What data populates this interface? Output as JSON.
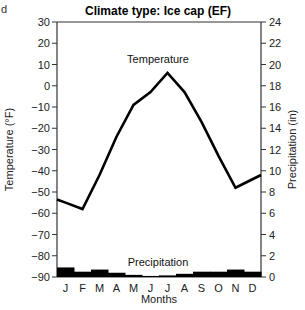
{
  "corner_fragment": "d",
  "chart_data": {
    "type": "line",
    "title": "Climate type: Ice cap (EF)",
    "xlabel": "Months",
    "ylabel": "Temperature (°F)",
    "y2label": "Precipitation (in)",
    "categories": [
      "J",
      "F",
      "M",
      "A",
      "M",
      "J",
      "J",
      "A",
      "S",
      "O",
      "N",
      "D"
    ],
    "ylim": [
      -90,
      30
    ],
    "yticks": [
      30,
      20,
      10,
      0,
      -10,
      -20,
      -30,
      -40,
      -50,
      -60,
      -70,
      -80,
      -90
    ],
    "y2lim": [
      0,
      24
    ],
    "y2ticks": [
      24,
      22,
      20,
      18,
      16,
      14,
      12,
      10,
      8,
      6,
      4,
      2,
      0
    ],
    "grid": false,
    "series": [
      {
        "name": "Temperature",
        "kind": "line",
        "axis": "left",
        "values": [
          -55,
          -58,
          -42,
          -24,
          -9,
          -3,
          6,
          -3,
          -17,
          -33,
          -48,
          -44
        ]
      },
      {
        "name": "Precipitation",
        "kind": "bar",
        "axis": "right",
        "values": [
          0.9,
          0.5,
          0.7,
          0.4,
          0.2,
          0.1,
          0.15,
          0.3,
          0.5,
          0.5,
          0.7,
          0.5
        ]
      }
    ],
    "annotations": [
      {
        "text": "Temperature",
        "series": "Temperature"
      },
      {
        "text": "Precipitation",
        "series": "Precipitation"
      }
    ],
    "colors": {
      "line": "#000000",
      "bars": "#000000",
      "axis": "#333333"
    }
  }
}
